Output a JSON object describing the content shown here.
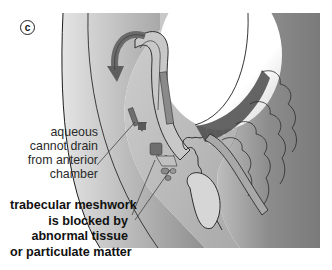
{
  "figure": {
    "panel_label": "c",
    "labels": [
      {
        "id": "aqueous-drain",
        "lines": [
          "aqueous",
          "cannot drain",
          "from anterior",
          "chamber"
        ],
        "weight": "normal"
      },
      {
        "id": "trabecular-block",
        "lines": [
          "trabecular meshwork",
          "is blocked by",
          "abnormal tissue",
          "or particulate matter"
        ],
        "weight": "bold"
      }
    ],
    "structures": [
      "lens",
      "iris",
      "aqueous-flow-arrow",
      "trabecular-meshwork",
      "ciliary-body",
      "ciliary-processes",
      "zonule-fibers",
      "cornea",
      "sclera"
    ],
    "colors": {
      "background": "#ffffff",
      "outline": "#1e1e1e",
      "light_tissue": "#d9d9d9",
      "mid_tissue": "#b4b4b4",
      "dark_tissue": "#7d7d7d",
      "arrow": "#6a6a6a",
      "blockage": "#595959"
    }
  }
}
